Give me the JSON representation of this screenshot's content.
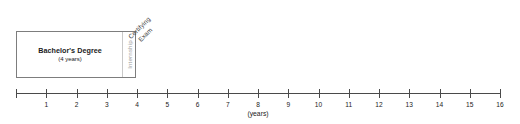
{
  "diagram": {
    "degree_block": {
      "label": "Bachelor's Degree",
      "duration": "(4 years)",
      "start_year": 0,
      "end_year": 4
    },
    "internship": {
      "label": "Internship",
      "start_year": 3.6,
      "end_year": 4,
      "text_color": "#9a9a9a"
    },
    "certifying_exam": {
      "label_line1": "Certifying",
      "label_line2": "Exam",
      "at_year": 4,
      "rotation_deg": -45
    },
    "axis": {
      "caption": "(years)",
      "caption_at_year": 8,
      "min": 0,
      "max": 16,
      "tick_labels": [
        "1",
        "2",
        "3",
        "4",
        "5",
        "6",
        "7",
        "8",
        "9",
        "10",
        "11",
        "12",
        "13",
        "14",
        "15",
        "16"
      ],
      "unlabeled_ticks": [
        "0"
      ],
      "line_color": "#4a4a4a"
    },
    "colors": {
      "box_border": "#7d7d7d",
      "text": "#1b1b1b",
      "muted": "#9a9a9a",
      "background": "#ffffff"
    }
  }
}
